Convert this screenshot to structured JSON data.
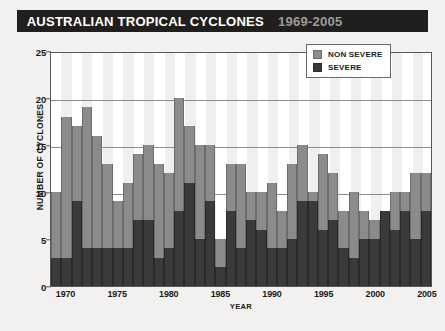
{
  "header": {
    "title_main": "AUSTRALIAN TROPICAL CYCLONES",
    "title_years": "1969-2005"
  },
  "legend": {
    "position": "top-right",
    "items": [
      {
        "label": "NON SEVERE",
        "color": "#8d8b8a",
        "swatch": "non-severe-swatch"
      },
      {
        "label": "SEVERE",
        "color": "#3b3a3a",
        "swatch": "severe-swatch"
      }
    ]
  },
  "chart_data": {
    "type": "bar",
    "stacked": true,
    "title": "AUSTRALIAN TROPICAL CYCLONES 1969-2005",
    "xlabel": "YEAR",
    "ylabel": "NUMBER OF CYCLONES",
    "ylim": [
      0,
      25
    ],
    "yticks": [
      0,
      5,
      10,
      15,
      20,
      25
    ],
    "xticks": [
      1970,
      1975,
      1980,
      1985,
      1990,
      1995,
      2000,
      2005
    ],
    "grid": true,
    "categories": [
      1969,
      1970,
      1971,
      1972,
      1973,
      1974,
      1975,
      1976,
      1977,
      1978,
      1979,
      1980,
      1981,
      1982,
      1983,
      1984,
      1985,
      1986,
      1987,
      1988,
      1989,
      1990,
      1991,
      1992,
      1993,
      1994,
      1995,
      1996,
      1997,
      1998,
      1999,
      2000,
      2001,
      2002,
      2003,
      2004,
      2005
    ],
    "series": [
      {
        "name": "SEVERE",
        "color": "#3b3a3a",
        "values": [
          3,
          3,
          9,
          4,
          4,
          4,
          4,
          4,
          7,
          7,
          3,
          4,
          8,
          11,
          5,
          9,
          2,
          8,
          4,
          7,
          6,
          4,
          4,
          5,
          9,
          9,
          6,
          7,
          4,
          3,
          5,
          5,
          8,
          6,
          8,
          5,
          8
        ]
      },
      {
        "name": "NON SEVERE",
        "color": "#8d8b8a",
        "values": [
          7,
          15,
          8,
          15,
          12,
          9,
          5,
          7,
          7,
          8,
          10,
          8,
          12,
          6,
          10,
          6,
          3,
          5,
          9,
          3,
          4,
          7,
          4,
          8,
          6,
          1,
          8,
          5,
          4,
          7,
          3,
          2,
          0,
          4,
          2,
          7,
          4
        ]
      }
    ],
    "totals": [
      10,
      18,
      17,
      19,
      16,
      13,
      9,
      11,
      14,
      15,
      13,
      12,
      20,
      17,
      15,
      15,
      5,
      13,
      13,
      10,
      10,
      11,
      8,
      13,
      15,
      10,
      14,
      12,
      8,
      10,
      8,
      7,
      8,
      10,
      10,
      12,
      12
    ]
  }
}
